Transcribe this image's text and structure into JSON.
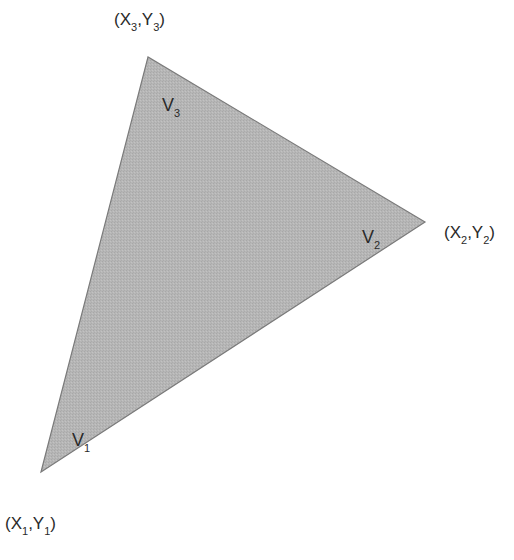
{
  "diagram": {
    "type": "triangle",
    "fill_color": "#b4b4b4",
    "stroke_color": "#7a7a7a",
    "vertices": [
      {
        "id": "v1",
        "x": 41,
        "y": 472,
        "label": "V",
        "label_sub": "1",
        "coord_label": {
          "open": "(X",
          "sub1": "1",
          "mid": ",Y",
          "sub2": "1",
          "close": ")"
        }
      },
      {
        "id": "v2",
        "x": 425,
        "y": 222,
        "label": "V",
        "label_sub": "2",
        "coord_label": {
          "open": "(X",
          "sub1": "2",
          "mid": ",Y",
          "sub2": "2",
          "close": ")"
        }
      },
      {
        "id": "v3",
        "x": 148,
        "y": 57,
        "label": "V",
        "label_sub": "3",
        "coord_label": {
          "open": "(X",
          "sub1": "3",
          "mid": ",Y",
          "sub2": "3",
          "close": ")"
        }
      }
    ]
  }
}
